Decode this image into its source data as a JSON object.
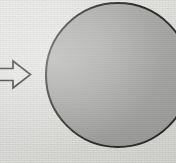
{
  "figure": {
    "caption_visible": false,
    "background_color": "#e9e9e6",
    "ghost_text": {
      "note": "faint show-through text from reverse side of scanned page, largely illegible",
      "line1": "ove",
      "line2": "ur ci",
      "line3": "owe"
    },
    "arrow": {
      "name": "block-arrow-right",
      "direction": "right",
      "style": "outlined block arrow",
      "outline_color": "#3a3a3a",
      "fill_color": "#e9e9e6",
      "x": 0,
      "y": 60,
      "width": 31,
      "height": 29
    },
    "circle": {
      "name": "shaded-circle",
      "fill_color": "#a8a8a8",
      "outline_color": "#2e2e2e",
      "outline_width": 2,
      "center_x": 118,
      "center_y": 75,
      "radius": 72
    },
    "dashed_line": {
      "name": "vertical-axis-of-symmetry",
      "orientation": "vertical",
      "color": "#585858",
      "stroke_width": 2,
      "dash_length": 5,
      "gap_length": 4,
      "x": 127,
      "y_top": 3,
      "y_bottom": 148
    }
  }
}
